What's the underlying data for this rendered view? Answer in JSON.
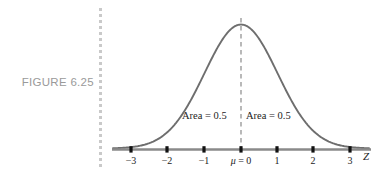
{
  "figure": {
    "label": "FIGURE 6.25",
    "divider_icon": "dotted-vertical-rule"
  },
  "annotations": {
    "area_left": "Area = 0.5",
    "area_right": "Area = 0.5",
    "mean_marker": "μ = 0",
    "axis_name": "Z"
  },
  "colors": {
    "curve": "#6e6e6e",
    "axis": "#8a8a8a",
    "tick": "#111111",
    "dashed_line": "#8a8a8a",
    "caption": "#9a9a9a",
    "divider_dot": "#c9c9c9",
    "text": "#1c1c1c",
    "background": "#ffffff"
  },
  "chart_data": {
    "type": "line",
    "title": "",
    "subtitle": "",
    "xlabel": "Z",
    "ylabel": "",
    "grid": false,
    "legend": null,
    "distribution": "standard normal",
    "mean": 0,
    "std_dev": 1,
    "xlim": [
      -3.5,
      3.5
    ],
    "ylim": [
      0,
      0.42
    ],
    "xticks": [
      -3,
      -2,
      -1,
      0,
      1,
      2,
      3
    ],
    "xticklabels": [
      "−3",
      "−2",
      "−1",
      "μ = 0",
      "1",
      "2",
      "3"
    ],
    "yticks": [],
    "yticklabels": [],
    "x": [
      -3.5,
      -3.25,
      -3,
      -2.75,
      -2.5,
      -2.25,
      -2,
      -1.75,
      -1.5,
      -1.25,
      -1,
      -0.75,
      -0.5,
      -0.25,
      0,
      0.25,
      0.5,
      0.75,
      1,
      1.25,
      1.5,
      1.75,
      2,
      2.25,
      2.5,
      2.75,
      3,
      3.25,
      3.5
    ],
    "values": [
      0.0009,
      0.002,
      0.0044,
      0.0091,
      0.0175,
      0.0317,
      0.054,
      0.0863,
      0.1295,
      0.1826,
      0.242,
      0.3011,
      0.3521,
      0.3867,
      0.3989,
      0.3867,
      0.3521,
      0.3011,
      0.242,
      0.1826,
      0.1295,
      0.0863,
      0.054,
      0.0317,
      0.0175,
      0.0091,
      0.0044,
      0.002,
      0.0009
    ],
    "annotations": [
      {
        "text": "Area = 0.5",
        "x": -1.0,
        "y": 0.09,
        "region": "left half"
      },
      {
        "text": "Area = 0.5",
        "x": 1.0,
        "y": 0.09,
        "region": "right half"
      },
      {
        "text": "μ = 0",
        "x": 0,
        "y": 0,
        "type": "mean-tick-label"
      }
    ],
    "vertical_reference_line": {
      "x": 0,
      "style": "dashed",
      "from_y": 0,
      "to_y": 0.3989
    }
  },
  "ticks": [
    {
      "id": "tick-neg3",
      "label": "−3",
      "value": -3,
      "px": 131
    },
    {
      "id": "tick-neg2",
      "label": "−2",
      "value": -2,
      "px": 167
    },
    {
      "id": "tick-neg1",
      "label": "−1",
      "value": -1,
      "px": 204
    },
    {
      "id": "tick-zero",
      "label": "μ = 0",
      "value": 0,
      "px": 241
    },
    {
      "id": "tick-pos1",
      "label": "1",
      "value": 1,
      "px": 277
    },
    {
      "id": "tick-pos2",
      "label": "2",
      "value": 2,
      "px": 313
    },
    {
      "id": "tick-pos3",
      "label": "3",
      "value": 3,
      "px": 350
    }
  ]
}
